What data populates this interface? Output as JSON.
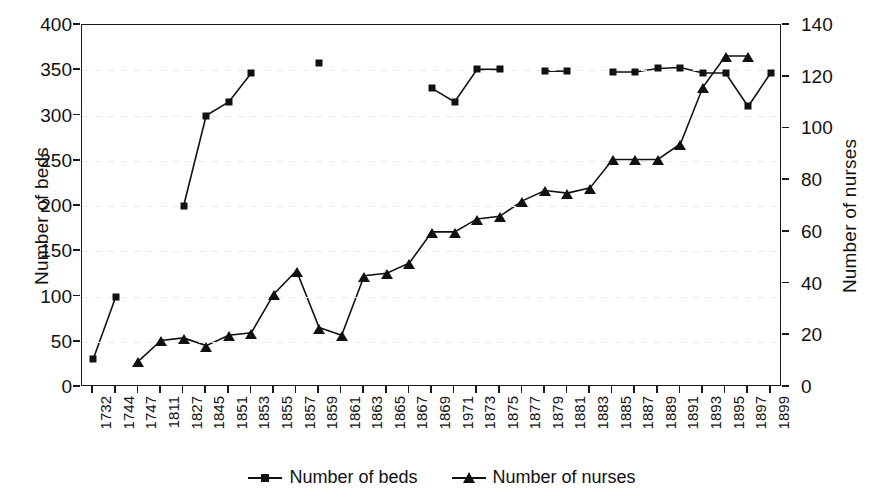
{
  "chart_data": {
    "type": "line",
    "title": "",
    "xlabel": "",
    "ylabel": "Number of beds",
    "y2label": "Number of nurses",
    "grid": true,
    "legend_position": "bottom-center",
    "ylim": [
      0,
      400
    ],
    "y2lim": [
      0,
      140
    ],
    "yticks": [
      0,
      50,
      100,
      150,
      200,
      250,
      300,
      350,
      400
    ],
    "y2ticks": [
      0,
      20,
      40,
      60,
      80,
      100,
      120,
      140
    ],
    "categories": [
      "1732",
      "1744",
      "1747",
      "1811",
      "1827",
      "1845",
      "1851",
      "1853",
      "1855",
      "1857",
      "1859",
      "1861",
      "1863",
      "1865",
      "1867",
      "1869",
      "1971",
      "1873",
      "1875",
      "1877",
      "1879",
      "1881",
      "1883",
      "1885",
      "1887",
      "1889",
      "1891",
      "1893",
      "1895",
      "1897",
      "1899"
    ],
    "series": [
      {
        "name": "Number of beds",
        "axis": "left",
        "marker": "square",
        "color": "#111111",
        "values": [
          31,
          100,
          null,
          null,
          200,
          300,
          315,
          347,
          null,
          null,
          358,
          null,
          null,
          null,
          null,
          330,
          315,
          351,
          351,
          null,
          349,
          349,
          null,
          348,
          348,
          352,
          353,
          347,
          347,
          310,
          347
        ]
      },
      {
        "name": "Number of nurses",
        "axis": "right",
        "marker": "triangle",
        "color": "#111111",
        "values": [
          null,
          null,
          10,
          18,
          19,
          16,
          20,
          21,
          36,
          45,
          23,
          20,
          43,
          44,
          48,
          60,
          60,
          65,
          66,
          72,
          76,
          75,
          77,
          88,
          88,
          88,
          94,
          116,
          128,
          128,
          null
        ]
      }
    ],
    "annotations": [
      "Beds series is plotted on the left axis (0-400)",
      "Nurses series is plotted on the right axis (0-140)",
      "Series are broken where data are missing"
    ]
  },
  "legend": {
    "items": [
      {
        "label": "Number of beds",
        "marker": "square-marker-icon"
      },
      {
        "label": "Number of nurses",
        "marker": "triangle-marker-icon"
      }
    ]
  }
}
